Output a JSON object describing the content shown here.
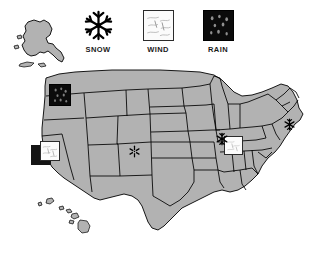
{
  "legend": {
    "items": [
      {
        "id": "snow",
        "icon": "snowflake-icon",
        "label": "SNOW",
        "color": "#000000"
      },
      {
        "id": "wind",
        "icon": "wind-square-icon",
        "label": "WIND",
        "color": "#fbfbfb"
      },
      {
        "id": "rain",
        "icon": "rain-square-icon",
        "label": "RAIN",
        "color": "#0b0b0b"
      }
    ]
  },
  "map": {
    "title": "United States weather map",
    "land_color": "#b2b2b2",
    "border_color": "#000000",
    "background_color": "#ffffff",
    "regions": [
      {
        "name": "contiguous-united-states"
      },
      {
        "name": "alaska"
      },
      {
        "name": "hawaii"
      }
    ]
  },
  "markers": [
    {
      "id": "marker-washington",
      "type": "rain",
      "label": "RAIN",
      "region": "Washington",
      "x": 49,
      "y": 84
    },
    {
      "id": "marker-california",
      "type": "wind",
      "label": "WIND",
      "region": "California",
      "x": 34,
      "y": 141
    },
    {
      "id": "marker-kansas",
      "type": "snow",
      "label": "SNOW",
      "region": "Kansas",
      "x": 128,
      "y": 145
    },
    {
      "id": "marker-illinois",
      "type": "snow",
      "label": "SNOW",
      "region": "Illinois",
      "x": 218,
      "y": 135
    },
    {
      "id": "marker-indiana",
      "type": "wind",
      "label": "WIND",
      "region": "Indiana",
      "x": 228,
      "y": 138
    },
    {
      "id": "marker-newjersey",
      "type": "snow",
      "label": "SNOW",
      "region": "New Jersey",
      "x": 283,
      "y": 118
    }
  ]
}
